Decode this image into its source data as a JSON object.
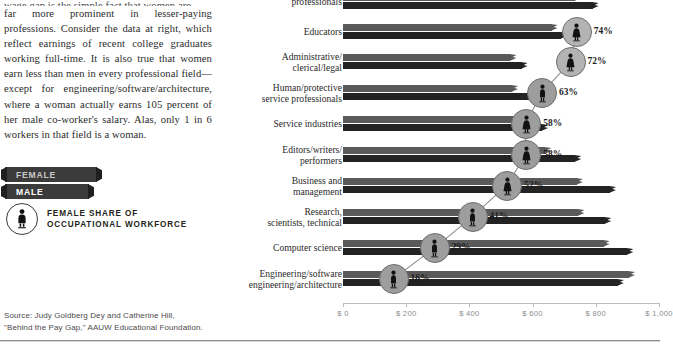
{
  "article": {
    "paragraph_clipped_top": "wage gap is the simple fact that women are",
    "paragraph": "far more prominent in lesser-paying professions. Consider the data at right, which reflect earnings of recent college graduates working full-time. It is also true that women earn less than men in every professional field—except for engineering/software/architecture, where a woman actually earns 105 percent of her male co-worker's salary. Alas, only 1 in 6 workers in that field is a woman."
  },
  "legend": {
    "female_label": "FEMALE",
    "male_label": "MALE",
    "key_line1": "FEMALE SHARE OF",
    "key_line2": "OCCUPATIONAL WORKFORCE",
    "key_icon": "female-figure-icon",
    "female_color": "#5a5a5a",
    "male_color": "#232323",
    "marker_color": "#9d9d9d"
  },
  "source": {
    "line1": "Source: Judy Goldberg Dey and Catherine Hill,",
    "line2": "\"Behind the Pay Gap,\" AAUW Educational Foundation."
  },
  "chart_data": {
    "type": "bar",
    "title": "",
    "xlabel": "",
    "ylabel": "",
    "xlim": [
      0,
      1000
    ],
    "grid": false,
    "legend_position": "left-panel",
    "axis_ticks": [
      "$ 0",
      "$ 200",
      "$ 400",
      "$ 600",
      "$ 800",
      "$ 1,000"
    ],
    "axis_tick_values": [
      0,
      200,
      400,
      600,
      800,
      1000
    ],
    "categories": [
      "professionals",
      "Educators",
      "Administrative/\nclerical/legal",
      "Human/protective\nservice professionals",
      "Service industries",
      "Editors/writers/\nperformers",
      "Business and\nmanagement",
      "Research,\nscientists, technical",
      "Computer science",
      "Engineering/software\nengineering/architecture"
    ],
    "series": [
      {
        "name": "FEMALE",
        "color": "#5a5a5a",
        "values": [
          735,
          660,
          530,
          535,
          560,
          640,
          740,
          745,
          825,
          905
        ]
      },
      {
        "name": "MALE",
        "color": "#232323",
        "values": [
          790,
          690,
          565,
          620,
          630,
          735,
          845,
          830,
          900,
          870
        ]
      }
    ],
    "female_share": [
      null,
      74,
      72,
      63,
      58,
      58,
      52,
      41,
      29,
      16
    ],
    "female_share_labels": [
      "",
      "74%",
      "72%",
      "63%",
      "58%",
      "58%",
      "52%",
      "41%",
      "29%",
      "16%"
    ],
    "marker_icons": [
      "female-figure-icon",
      "female-figure-icon",
      "female-figure-icon",
      "male-figure-icon",
      "female-figure-icon",
      "female-figure-icon",
      "female-figure-icon",
      "male-figure-icon",
      "male-figure-icon",
      "male-figure-icon"
    ]
  }
}
